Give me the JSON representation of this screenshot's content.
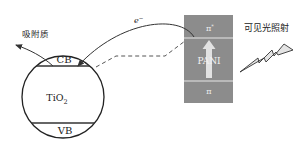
{
  "diagram": {
    "tio2": {
      "label": "TiO",
      "subscript": "2",
      "cb_label": "CB",
      "vb_label": "VB"
    },
    "pani": {
      "label": "PANI",
      "pi_star_label": "π",
      "pi_star_sup": "*",
      "pi_label": "π",
      "fill_color": "#8a8a8a"
    },
    "electron": {
      "label": "e",
      "sup": "−"
    },
    "adsorbate_label": "吸附质",
    "light_label": "可见光照射",
    "icons": {
      "light": "lightning-bolt-icon",
      "excitation": "up-arrow-icon"
    }
  }
}
